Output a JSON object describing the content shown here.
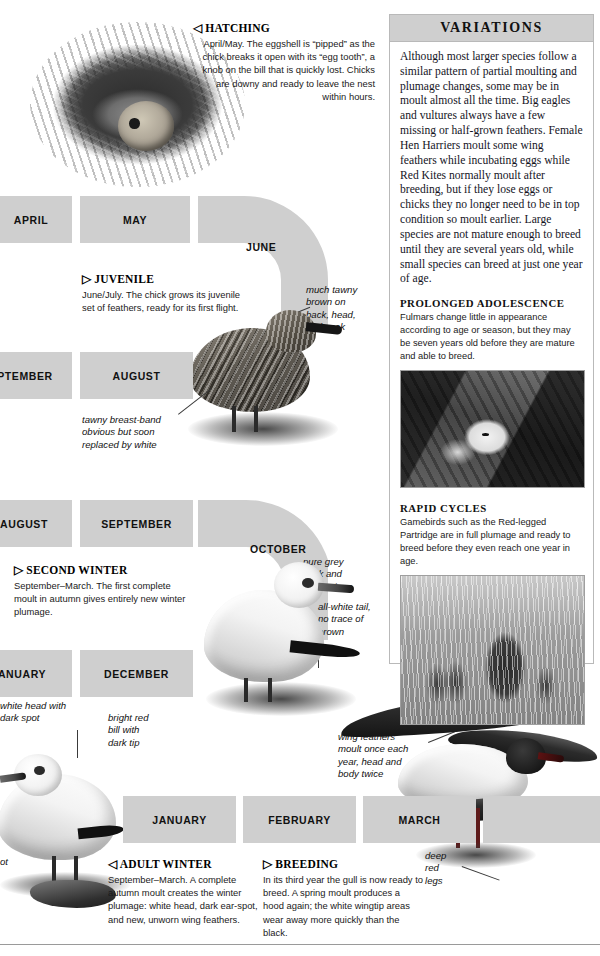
{
  "page": {
    "width": 600,
    "height": 956,
    "background": "#ffffff",
    "ribbon_color": "#cfcfcf",
    "panel_border": "#b9b9b9"
  },
  "timeline": {
    "name": "moult-and-plumage-calendar",
    "months": [
      {
        "label": "APRIL",
        "row": 1
      },
      {
        "label": "MAY",
        "row": 1
      },
      {
        "label": "JUNE",
        "row": 1,
        "shape": "arc"
      },
      {
        "label": "PTEMBER",
        "row": 2
      },
      {
        "label": "AUGUST",
        "row": 2
      },
      {
        "label": "AUGUST",
        "row": 3
      },
      {
        "label": "SEPTEMBER",
        "row": 3
      },
      {
        "label": "OCTOBER",
        "row": 3,
        "shape": "arc"
      },
      {
        "label": "ANUARY",
        "row": 4
      },
      {
        "label": "DECEMBER",
        "row": 4
      },
      {
        "label": "JANUARY",
        "row": 5
      },
      {
        "label": "FEBRUARY",
        "row": 5
      },
      {
        "label": "MARCH",
        "row": 5
      }
    ]
  },
  "captions": {
    "hatching": {
      "marker": "◁",
      "title": "HATCHING",
      "body": "April/May. The eggshell is “pipped” as the chick breaks it open with its “egg tooth”, a knob on the bill that is quickly lost. Chicks are downy and ready to leave the nest within hours."
    },
    "juvenile": {
      "marker": "▷",
      "title": "JUVENILE",
      "body": "June/July. The chick grows its juvenile set of feathers, ready for its first flight."
    },
    "second_winter": {
      "marker": "▷",
      "title": "SECOND WINTER",
      "body": "September–March. The first complete moult in autumn gives entirely new winter plumage."
    },
    "adult_winter": {
      "marker": "◁",
      "title": "ADULT WINTER",
      "body": "September–March. A complete autumn moult creates the winter plumage: white head, dark ear-spot, and new, unworn wing feathers."
    },
    "breeding": {
      "marker": "▷",
      "title": "BREEDING",
      "body": "In its third year the gull is now ready to breed. A spring moult produces a hood again; the white wingtip areas wear away more quickly than the black."
    }
  },
  "annotations": [
    {
      "id": "tawny-brown",
      "text": "much tawny\nbrown on\nback, head,\nand neck"
    },
    {
      "id": "tawny-breast-band",
      "text": "tawny breast-band\nobvious but soon\nreplaced by white"
    },
    {
      "id": "pure-grey",
      "text": "pure grey\nback and\nupperwings"
    },
    {
      "id": "all-white-tail",
      "text": "all-white tail,\nno trace of\nbrown"
    },
    {
      "id": "white-head",
      "text": "white head with\ndark spot"
    },
    {
      "id": "bright-red-bill",
      "text": "bright red\nbill with\ndark tip"
    },
    {
      "id": "wing-feathers",
      "text": "wing feathers\nmoult once each\nyear, head and\nbody twice"
    },
    {
      "id": "deep-red-legs",
      "text": "deep\nred\nlegs"
    },
    {
      "id": "spot-partial",
      "text": "ot"
    }
  ],
  "variations": {
    "heading": "VARIATIONS",
    "intro": "Although most larger species follow a similar pattern of partial moulting and plumage changes, some may be in moult almost all the time. Big eagles and vultures always have a few missing or half-grown feathers. Female Hen Harriers moult some wing feathers while incubating eggs while Red Kites normally moult after breeding, but if they lose eggs or chicks they no longer need to be in top condition so moult earlier. Large species are not mature enough to breed until they are several years old, while small species can breed at just one year of age.",
    "sections": [
      {
        "heading": "PROLONGED ADOLESCENCE",
        "text": "Fulmars change little in appearance according to age or season, but they may be seven years old before they are mature and able to breed.",
        "photo_alt": "fulmar-on-nest-photo"
      },
      {
        "heading": "RAPID CYCLES",
        "text": "Gamebirds such as the Red-legged Partridge are in full plumage and ready to breed before they even reach one year in age.",
        "photo_alt": "red-legged-partridge-covey-photo"
      }
    ]
  },
  "photos": {
    "nest": "black-headed-gull-nest-with-egg-and-chick-photo"
  }
}
